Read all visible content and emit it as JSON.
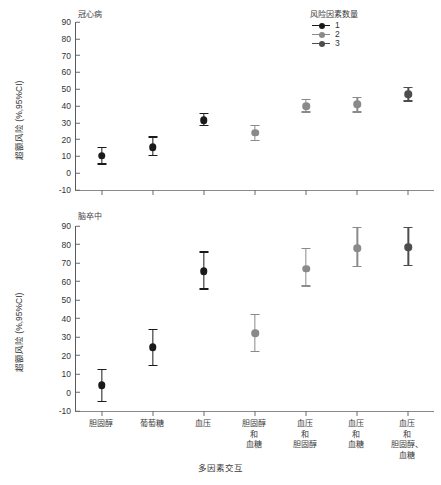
{
  "figure": {
    "xaxis_title": "多因素交互",
    "ylabel": "超额风险 (%,95%CI)"
  },
  "legend": {
    "title": "风险因素数量",
    "items": [
      {
        "label": "1",
        "color": "#1a1a1a"
      },
      {
        "label": "2",
        "color": "#8a8a8a"
      },
      {
        "label": "3",
        "color": "#4d4d4d"
      }
    ]
  },
  "panels": [
    {
      "key": "chd",
      "title": "冠心病"
    },
    {
      "key": "stroke",
      "title": "脑卒中"
    }
  ],
  "yticks": [
    "90",
    "80",
    "70",
    "60",
    "50",
    "40",
    "30",
    "20",
    "10",
    "0",
    "-10"
  ],
  "xcategories": [
    "胆固醇",
    "葡萄糖",
    "血压",
    "胆固醇\n和\n血糖",
    "血压\n和\n胆固醇",
    "血压\n和\n血糖",
    "血压\n和\n胆固醇、\n血糖"
  ],
  "chart_data": {
    "type": "scatter",
    "xlabel": "多因素交互",
    "ylabel": "超额风险 (%,95%CI)",
    "ylim": [
      -10,
      90
    ],
    "ytick_step": 10,
    "grid": false,
    "legend_position": "top-right",
    "legend_title": "风险因素数量",
    "categories": [
      "胆固醇",
      "葡萄糖",
      "血压",
      "胆固醇和血糖",
      "血压和胆固醇",
      "血压和血糖",
      "血压和胆固醇、血糖"
    ],
    "group_by_category": [
      1,
      1,
      1,
      2,
      2,
      2,
      3
    ],
    "panels": [
      {
        "name": "冠心病",
        "points": [
          {
            "category": "胆固醇",
            "n_factors": 1,
            "value": 10.5,
            "low": 5.5,
            "high": 15.5
          },
          {
            "category": "葡萄糖",
            "n_factors": 1,
            "value": 15.5,
            "low": 10.5,
            "high": 21.5
          },
          {
            "category": "血压",
            "n_factors": 1,
            "value": 31.5,
            "low": 28.5,
            "high": 35.5
          },
          {
            "category": "胆固醇和血糖",
            "n_factors": 2,
            "value": 24.0,
            "low": 19.5,
            "high": 28.5
          },
          {
            "category": "血压和胆固醇",
            "n_factors": 2,
            "value": 40.0,
            "low": 36.5,
            "high": 44.0
          },
          {
            "category": "血压和血糖",
            "n_factors": 2,
            "value": 41.0,
            "low": 36.5,
            "high": 45.0
          },
          {
            "category": "血压和胆固醇、血糖",
            "n_factors": 3,
            "value": 47.0,
            "low": 43.0,
            "high": 51.0
          }
        ]
      },
      {
        "name": "脑卒中",
        "points": [
          {
            "category": "胆固醇",
            "n_factors": 1,
            "value": 4.0,
            "low": -5.0,
            "high": 12.5
          },
          {
            "category": "葡萄糖",
            "n_factors": 1,
            "value": 24.5,
            "low": 14.5,
            "high": 34.0
          },
          {
            "category": "血压",
            "n_factors": 1,
            "value": 65.5,
            "low": 56.0,
            "high": 76.0
          },
          {
            "category": "胆固醇和血糖",
            "n_factors": 2,
            "value": 32.0,
            "low": 22.0,
            "high": 42.0
          },
          {
            "category": "血压和胆固醇",
            "n_factors": 2,
            "value": 67.0,
            "low": 57.5,
            "high": 78.0
          },
          {
            "category": "血压和血糖",
            "n_factors": 2,
            "value": 78.0,
            "low": 68.0,
            "high": 89.0
          },
          {
            "category": "血压和胆固醇、血糖",
            "n_factors": 3,
            "value": 78.5,
            "low": 68.5,
            "high": 89.0
          }
        ]
      }
    ]
  }
}
